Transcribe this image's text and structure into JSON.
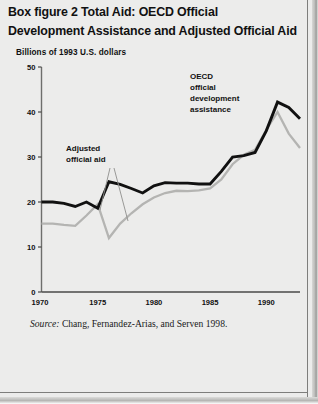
{
  "figure": {
    "title_line1": "Box figure 2  Total Aid: OECD Official",
    "title_line2": "Development Assistance and Adjusted Official Aid",
    "subtitle": "Billions of 1993 U.S. dollars",
    "source_prefix": "Source:",
    "source_text": " Chang, Fernandez-Arias, and Serven 1998."
  },
  "annotations": {
    "adjusted_l1": "Adjusted",
    "adjusted_l2": "official aid",
    "oecd_l1": "OECD",
    "oecd_l2": "official",
    "oecd_l3": "development",
    "oecd_l4": "assistance"
  },
  "colors": {
    "oecd_line": "#111111",
    "adjusted_line": "#b4b4b2",
    "axis": "#6e6e6c",
    "background": "#ececeb",
    "text": "#111111"
  },
  "chart_data": {
    "type": "line",
    "title": "Box figure 2  Total Aid: OECD Official Development Assistance and Adjusted Official Aid",
    "xlabel": "",
    "ylabel": "Billions of 1993 U.S. dollars",
    "xlim": [
      1970,
      1993
    ],
    "ylim": [
      0,
      50
    ],
    "yticks": [
      0,
      10,
      20,
      30,
      40,
      50
    ],
    "xticks": [
      1970,
      1975,
      1980,
      1985,
      1990
    ],
    "xticklabels": [
      "1970",
      "1975",
      "1980",
      "1985",
      "1990"
    ],
    "yticklabels": [
      "0",
      "10",
      "20",
      "30",
      "40",
      "50"
    ],
    "grid": false,
    "legend": "inline-annotations",
    "x": [
      1970,
      1971,
      1972,
      1973,
      1974,
      1975,
      1976,
      1977,
      1978,
      1979,
      1980,
      1981,
      1982,
      1983,
      1984,
      1985,
      1986,
      1987,
      1988,
      1989,
      1990,
      1991,
      1992,
      1993
    ],
    "series": [
      {
        "name": "OECD official development assistance",
        "color": "#111111",
        "label_line1": "OECD",
        "label_line2": "official",
        "label_line3": "development",
        "label_line4": "assistance",
        "values": [
          20.0,
          20.0,
          19.7,
          19.0,
          20.0,
          18.6,
          24.5,
          23.9,
          23.0,
          22.0,
          23.6,
          24.3,
          24.2,
          24.2,
          24.0,
          24.0,
          26.8,
          30.0,
          30.3,
          31.0,
          35.8,
          42.2,
          41.0,
          38.5
        ]
      },
      {
        "name": "Adjusted official aid",
        "color": "#b4b4b2",
        "label_line1": "Adjusted",
        "label_line2": "official aid",
        "values": [
          15.2,
          15.2,
          14.9,
          14.7,
          17.0,
          19.5,
          12.0,
          15.2,
          17.5,
          19.5,
          21.0,
          22.0,
          22.5,
          22.4,
          22.6,
          23.0,
          25.0,
          28.4,
          30.5,
          31.6,
          36.0,
          40.0,
          35.2,
          32.0
        ]
      }
    ]
  }
}
